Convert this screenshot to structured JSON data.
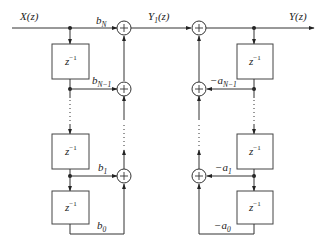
{
  "diagram": {
    "type": "direct-form-II-filter",
    "input_label": "X(z)",
    "intermediate_label": {
      "base": "Y",
      "sub": "1",
      "tail": "(z)"
    },
    "output_label": "Y(z)",
    "delay_label": {
      "base": "z",
      "sup": "−1"
    },
    "feedforward_coefficients": [
      {
        "base": "b",
        "sub": "N"
      },
      {
        "base": "b",
        "sub": "N−1"
      },
      {
        "base": "b",
        "sub": "1"
      },
      {
        "base": "b",
        "sub": "0"
      }
    ],
    "feedback_coefficients": [
      {
        "base": "−a",
        "sub": "N−1"
      },
      {
        "base": "−a",
        "sub": "1"
      },
      {
        "base": "−a",
        "sub": "0"
      }
    ],
    "adder_symbol": "+"
  }
}
